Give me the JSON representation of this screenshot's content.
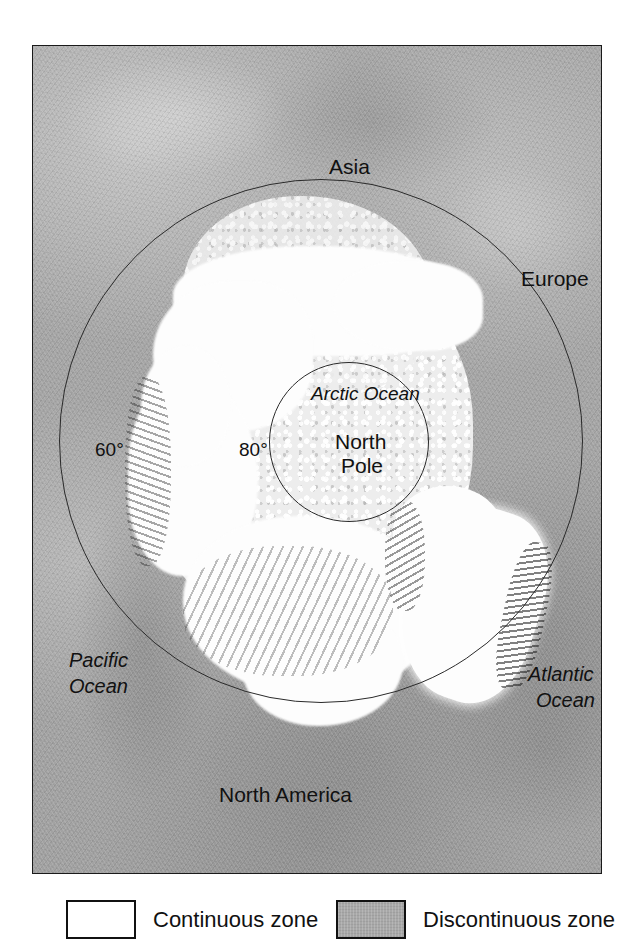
{
  "figure": {
    "type": "map"
  },
  "map": {
    "labels": {
      "asia": "Asia",
      "europe": "Europe",
      "north_america": "North America",
      "pacific_ocean_line1": "Pacific",
      "pacific_ocean_line2": "Ocean",
      "atlantic_ocean_line1": "Atlantic",
      "atlantic_ocean_line2": "Ocean",
      "arctic_ocean": "Arctic Ocean",
      "north_pole_line1": "North",
      "north_pole_line2": "Pole",
      "lat_60": "60°",
      "lat_80": "80°"
    }
  },
  "legend": {
    "items": [
      {
        "label": "Continuous zone",
        "color": "#ffffff",
        "swatch": "white-box"
      },
      {
        "label": "Discontinuous zone",
        "color": "#a8a8a8",
        "swatch": "gray-box"
      }
    ]
  },
  "colors": {
    "continuous_zone": "#ffffff",
    "discontinuous_zone": "#a8a8a8",
    "land_relief": "#a9a9a9",
    "sea_ice": "#ededed",
    "outline": "#1a1a1a"
  }
}
